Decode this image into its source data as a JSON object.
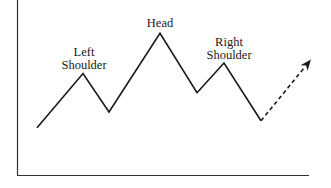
{
  "diagram": {
    "labels": {
      "left_shoulder": [
        "Left",
        "Shoulder"
      ],
      "head": [
        "Head"
      ],
      "right_shoulder": [
        "Right",
        "Shoulder"
      ]
    },
    "pattern_points": [
      {
        "name": "start",
        "level": 0.27
      },
      {
        "name": "left-shoulder-peak",
        "level": 0.58
      },
      {
        "name": "trough-1",
        "level": 0.36
      },
      {
        "name": "head-peak",
        "level": 0.81
      },
      {
        "name": "trough-2",
        "level": 0.47
      },
      {
        "name": "right-shoulder-peak",
        "level": 0.64
      },
      {
        "name": "trough-3",
        "level": 0.31
      }
    ],
    "projection": {
      "style": "dashed-arrow",
      "direction": "up",
      "target_level": 0.66
    },
    "colors": {
      "line": "#1a1a1a",
      "axis": "#333333",
      "background": "#ffffff"
    }
  }
}
